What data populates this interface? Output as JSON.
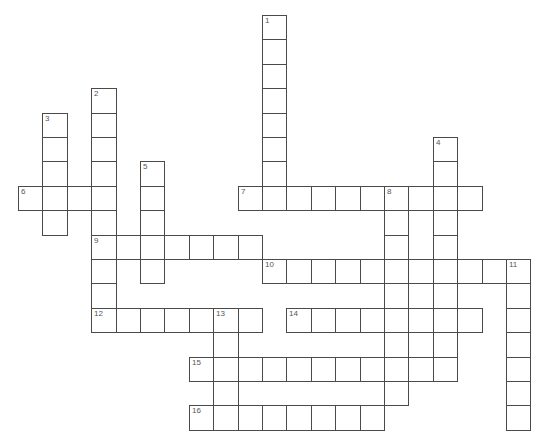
{
  "puzzle": {
    "type": "crossword",
    "grid": {
      "origin_x": 18,
      "origin_y": 15,
      "cell_size": 24.4,
      "line_color": "#4a4a4a",
      "number_color": "#555555",
      "background": "#ffffff"
    },
    "words": [
      {
        "number": "1",
        "direction": "down",
        "col": 10,
        "row": 0,
        "length": 8
      },
      {
        "number": "2",
        "direction": "down",
        "col": 3,
        "row": 3,
        "length": 10
      },
      {
        "number": "3",
        "direction": "down",
        "col": 1,
        "row": 4,
        "length": 5
      },
      {
        "number": "4",
        "direction": "down",
        "col": 17,
        "row": 5,
        "length": 10
      },
      {
        "number": "5",
        "direction": "down",
        "col": 5,
        "row": 6,
        "length": 5
      },
      {
        "number": "6",
        "direction": "across",
        "col": 0,
        "row": 7,
        "length": 4
      },
      {
        "number": "7",
        "direction": "across",
        "col": 9,
        "row": 7,
        "length": 10
      },
      {
        "number": "8",
        "direction": "down",
        "col": 15,
        "row": 7,
        "length": 9
      },
      {
        "number": "9",
        "direction": "across",
        "col": 3,
        "row": 9,
        "length": 7
      },
      {
        "number": "10",
        "direction": "across",
        "col": 10,
        "row": 10,
        "length": 11
      },
      {
        "number": "11",
        "direction": "down",
        "col": 20,
        "row": 10,
        "length": 7
      },
      {
        "number": "12",
        "direction": "across",
        "col": 3,
        "row": 12,
        "length": 7
      },
      {
        "number": "13",
        "direction": "down",
        "col": 8,
        "row": 12,
        "length": 5
      },
      {
        "number": "14",
        "direction": "across",
        "col": 11,
        "row": 12,
        "length": 8
      },
      {
        "number": "15",
        "direction": "across",
        "col": 7,
        "row": 14,
        "length": 11
      },
      {
        "number": "16",
        "direction": "across",
        "col": 7,
        "row": 16,
        "length": 8
      }
    ]
  }
}
